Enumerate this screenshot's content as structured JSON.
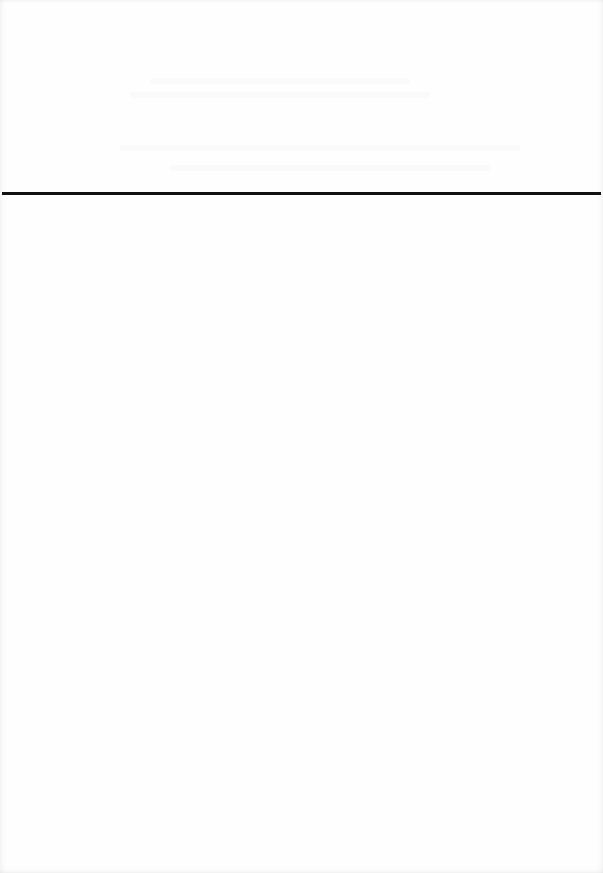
{
  "document": {
    "type": "scanned-page",
    "background_color": "#ffffff",
    "header_text_legible": false,
    "divider": {
      "color": "#111111",
      "y": 193,
      "thickness": 3
    },
    "body_text": ""
  }
}
